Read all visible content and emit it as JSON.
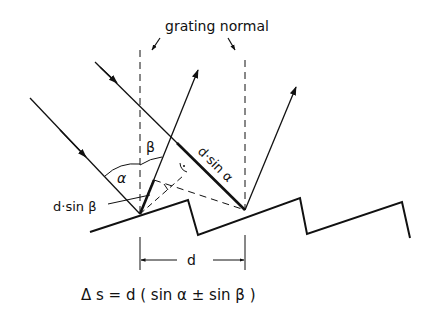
{
  "diagram": {
    "title_label": "grating normal",
    "labels": {
      "beta": "β",
      "alpha": "α",
      "d_sin_beta": "d·sin β",
      "d_sin_alpha": "d·sin α",
      "d": "d"
    },
    "equation": "Δ s = d ( sin α ± sin β )",
    "colors": {
      "ink": "#111111",
      "background": "#ffffff"
    }
  }
}
